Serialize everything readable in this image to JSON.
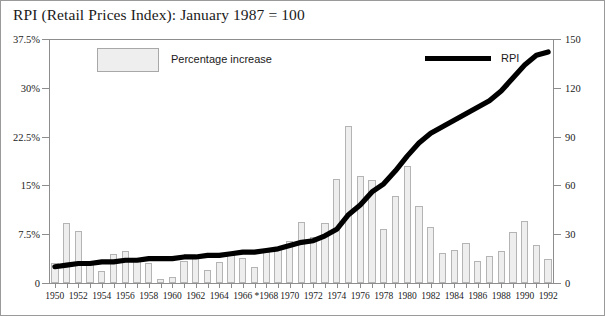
{
  "chart_data": {
    "type": "bar",
    "title": "RPI (Retail Prices Index): January 1987 = 100",
    "xlabel": "",
    "ylabel": "",
    "y_left_label": "Percentage increase",
    "y_right_label": "RPI index",
    "ylim": [
      0,
      37.5
    ],
    "ylim_right": [
      0,
      150
    ],
    "grid": false,
    "legend_position": "top",
    "y_left_ticks": [
      "0",
      "7.5%",
      "15%",
      "22.5%",
      "30%",
      "37.5%"
    ],
    "y_left_tick_values": [
      0,
      7.5,
      15,
      22.5,
      30,
      37.5
    ],
    "y_right_ticks": [
      "0",
      "30",
      "60",
      "90",
      "120",
      "150"
    ],
    "y_right_tick_values": [
      0,
      30,
      60,
      90,
      120,
      150
    ],
    "categories": [
      "1950",
      "1951",
      "1952",
      "1953",
      "1954",
      "1955",
      "1956",
      "1957",
      "1958",
      "1959",
      "1960",
      "1961",
      "1962",
      "1963",
      "1964",
      "1965",
      "1966",
      "1967",
      "*1968",
      "1969",
      "1970",
      "1971",
      "1972",
      "1973",
      "1974",
      "1975",
      "1976",
      "1977",
      "1978",
      "1979",
      "1980",
      "1981",
      "1982",
      "1983",
      "1984",
      "1985",
      "1986",
      "1987",
      "1988",
      "1989",
      "1990",
      "1991",
      "1992"
    ],
    "x_tick_labels": [
      "1950",
      "1952",
      "1954",
      "1956",
      "1958",
      "1960",
      "1962",
      "1964",
      "1966",
      "*1968",
      "1970",
      "1972",
      "1974",
      "1976",
      "1978",
      "1980",
      "1982",
      "1984",
      "1986",
      "1988",
      "1990",
      "1992"
    ],
    "series": [
      {
        "name": "Percentage increase",
        "type": "bar",
        "axis": "left",
        "values": [
          3.1,
          9.3,
          8.0,
          3.1,
          1.8,
          4.5,
          4.9,
          3.7,
          3.0,
          0.6,
          1.0,
          3.4,
          4.3,
          2.0,
          3.3,
          4.8,
          3.9,
          2.5,
          4.7,
          5.4,
          6.4,
          9.4,
          7.1,
          9.2,
          16.0,
          24.2,
          16.5,
          15.8,
          8.3,
          13.4,
          18.0,
          11.9,
          8.6,
          4.6,
          5.0,
          6.1,
          3.4,
          4.2,
          4.9,
          7.8,
          9.5,
          5.9,
          3.7
        ]
      },
      {
        "name": "RPI",
        "type": "line",
        "axis": "right",
        "values": [
          10,
          11,
          12,
          12,
          13,
          13,
          14,
          14,
          15,
          15,
          15,
          16,
          16,
          17,
          17,
          18,
          19,
          19,
          20,
          21,
          23,
          25,
          26,
          29,
          33,
          42,
          48,
          56,
          61,
          69,
          81,
          91,
          99,
          103,
          109,
          115,
          119,
          124,
          130,
          140,
          153,
          162,
          168
        ],
        "display_values": [
          10,
          11,
          12,
          12,
          13,
          13,
          14,
          14,
          15,
          15,
          15,
          16,
          16,
          17,
          17,
          18,
          19,
          19,
          20,
          21,
          23,
          25,
          26,
          29,
          33,
          42,
          48,
          56,
          61,
          69,
          78,
          86,
          92,
          96,
          100,
          104,
          108,
          112,
          118,
          126,
          134,
          140,
          142
        ]
      }
    ]
  },
  "legend": {
    "bar_label": "Percentage increase",
    "line_label": "RPI"
  }
}
